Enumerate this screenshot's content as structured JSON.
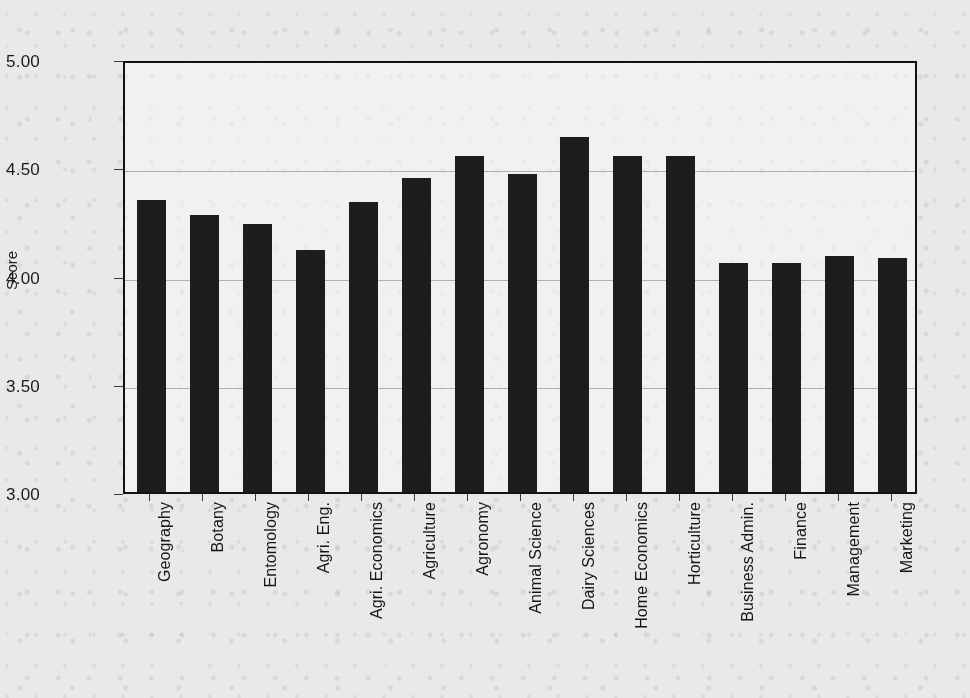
{
  "chart_data": {
    "type": "bar",
    "title": "",
    "xlabel": "",
    "ylabel": "Score",
    "ylim": [
      3.0,
      5.0
    ],
    "ytick_labels": [
      "5.00",
      "4.50",
      "4.00",
      "3.50",
      "3.00"
    ],
    "yticks": [
      5.0,
      4.5,
      4.0,
      3.5,
      3.0
    ],
    "grid": "horizontal",
    "legend": "none",
    "bar_color": "#1d1d1d",
    "background_color": "#e9e9e7",
    "axis_color": "#111111",
    "gridline_color": "#9a9a98",
    "categories": [
      "Geography",
      "Botany",
      "Entomology",
      "Agri. Eng.",
      "Agri. Economics",
      "Agriculture",
      "Agronomy",
      "Animal Science",
      "Dairy Sciences",
      "Home Economics",
      "Horticulture",
      "Business Admin.",
      "Finance",
      "Management",
      "Marketing"
    ],
    "values": [
      4.35,
      4.28,
      4.24,
      4.12,
      4.34,
      4.45,
      4.55,
      4.47,
      4.64,
      4.55,
      4.55,
      4.06,
      4.06,
      4.09,
      4.08
    ]
  }
}
